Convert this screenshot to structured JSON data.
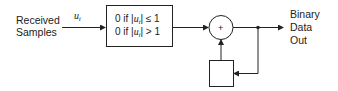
{
  "input": {
    "label_line1": "Received",
    "label_line2": "Samples",
    "signal_symbol": "u",
    "signal_subscript": "t"
  },
  "decision_block": {
    "row1": {
      "value": "0 if |",
      "var": "u",
      "sub": "t",
      "cond": "| ≤ 1"
    },
    "row2": {
      "value": "0 if |",
      "var": "u",
      "sub": "t",
      "cond": "| > 1"
    }
  },
  "summer": {
    "symbol": "+"
  },
  "delay_block": {
    "label": ""
  },
  "output": {
    "label_line1": "Binary",
    "label_line2": "Data",
    "label_line3": "Out"
  },
  "colors": {
    "line": "#222222",
    "background": "#ffffff"
  }
}
